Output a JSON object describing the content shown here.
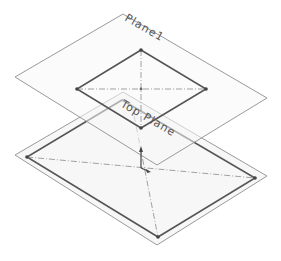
{
  "diagram": {
    "planes": [
      {
        "id": "plane1",
        "label": "Plane1"
      },
      {
        "id": "top-plane",
        "label": "Top Plane"
      }
    ],
    "colors": {
      "plane_edge": "#9a9a9a",
      "sketch_edge": "#555555",
      "centerline": "#8a8a8a",
      "vertex": "#444444",
      "plane_fill": "#f6f6f6"
    }
  }
}
